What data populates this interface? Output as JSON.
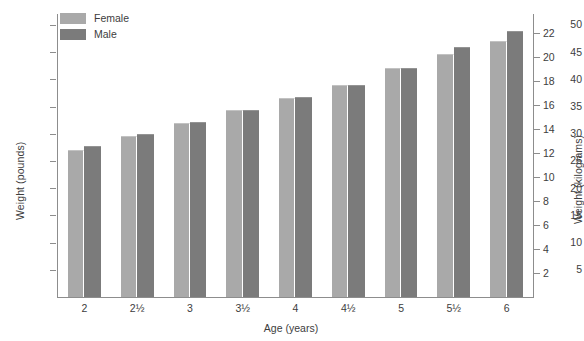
{
  "chart_data": {
    "type": "bar",
    "title": "",
    "xlabel": "Age (years)",
    "ylabel": "Weight (pounds)",
    "ylabel_secondary": "Weight (kilograms)",
    "grid": false,
    "legend_position": "top-left",
    "categories": [
      "2",
      "2½",
      "3",
      "3½",
      "4",
      "4½",
      "5",
      "5½",
      "6"
    ],
    "series": [
      {
        "name": "Female",
        "color": "#a9a9a9",
        "values": [
          27.0,
          29.6,
          32.0,
          34.3,
          36.6,
          38.9,
          42.0,
          44.6,
          47.0
        ]
      },
      {
        "name": "Male",
        "color": "#7b7b7b",
        "values": [
          27.8,
          30.0,
          32.2,
          34.4,
          36.8,
          38.9,
          42.0,
          46.0,
          48.8
        ]
      }
    ],
    "ylim": [
      0,
      52
    ],
    "ylim_secondary": [
      0,
      23.6
    ],
    "yticks": [
      5,
      10,
      15,
      20,
      25,
      30,
      35,
      40,
      45,
      50
    ],
    "yticklabels": [
      "5",
      "10",
      "15",
      "20",
      "25",
      "30",
      "35",
      "40",
      "45",
      "50"
    ],
    "yticks_secondary": [
      2,
      4,
      6,
      8,
      10,
      12,
      14,
      16,
      18,
      20,
      22
    ],
    "yticklabels_secondary": [
      "2",
      "4",
      "6",
      "8",
      "10",
      "12",
      "14",
      "16",
      "18",
      "20",
      "22"
    ],
    "axis_color": "#8d8d8d",
    "background_color": "#ffffff"
  },
  "legend": {
    "items": [
      {
        "label": "Female",
        "color": "#a9a9a9"
      },
      {
        "label": "Male",
        "color": "#7b7b7b"
      }
    ]
  }
}
